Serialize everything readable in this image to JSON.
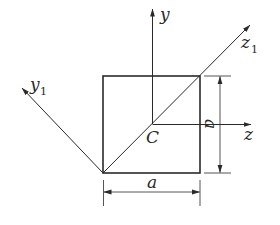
{
  "diagram": {
    "type": "square cross-section with centroidal and rotated axes",
    "colors": {
      "line": "#2a2a2a",
      "background": "#ffffff"
    },
    "labels": {
      "y_axis": "y",
      "z_axis": "z",
      "y1_axis_base": "y",
      "y1_axis_sub": "1",
      "z1_axis_base": "z",
      "z1_axis_sub": "1",
      "centroid": "C",
      "width_dim": "a",
      "height_dim": "a"
    },
    "geometry": {
      "square": {
        "x": 103,
        "y": 76,
        "width": 97,
        "height": 97
      },
      "centroid": {
        "x": 152,
        "y": 124
      }
    }
  }
}
